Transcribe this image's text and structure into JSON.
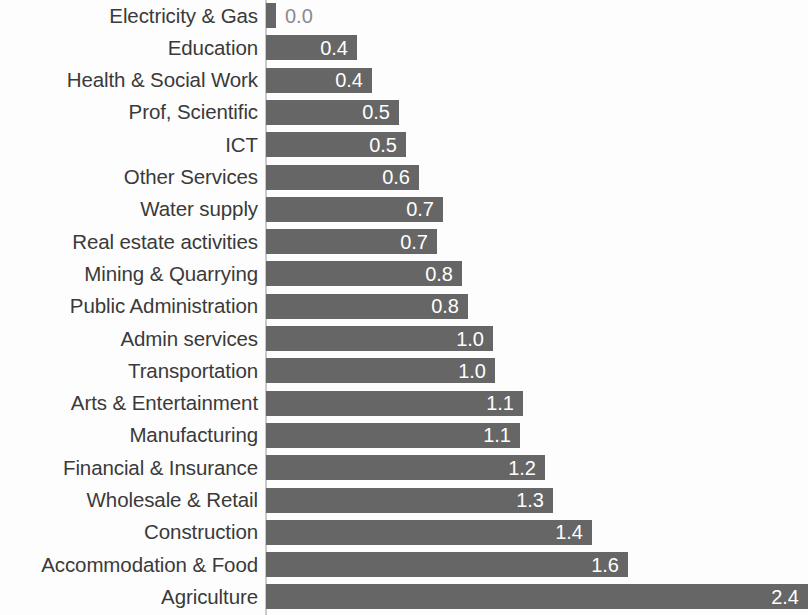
{
  "chart_data": {
    "type": "bar",
    "orientation": "horizontal",
    "title": "",
    "subtitle": "",
    "xlabel": "",
    "ylabel": "",
    "xlim": [
      0,
      2.4
    ],
    "grid": false,
    "legend": false,
    "bar_color": "#666666",
    "value_label_color": "#ffffff",
    "category_label_color": "#3a3a3a",
    "background_color": "#fdfdfd",
    "categories": [
      "Electricity & Gas",
      "Education",
      "Health & Social Work",
      "Prof, Scientific",
      "ICT",
      "Other Services",
      "Water supply",
      "Real estate activities",
      "Mining & Quarrying",
      "Public Administration",
      "Admin services",
      "Transportation",
      "Arts & Entertainment",
      "Manufacturing",
      "Financial & Insurance",
      "Wholesale & Retail",
      "Construction",
      "Accommodation & Food",
      "Agriculture"
    ],
    "values": [
      0.0,
      0.4,
      0.4,
      0.5,
      0.5,
      0.6,
      0.7,
      0.7,
      0.8,
      0.8,
      1.0,
      1.0,
      1.1,
      1.1,
      1.2,
      1.3,
      1.4,
      1.6,
      2.4
    ],
    "value_labels": [
      "0.0",
      "0.4",
      "0.4",
      "0.5",
      "0.5",
      "0.6",
      "0.7",
      "0.7",
      "0.8",
      "0.8",
      "1.0",
      "1.0",
      "1.1",
      "1.1",
      "1.2",
      "1.3",
      "1.4",
      "1.6",
      "2.4"
    ],
    "bars": [
      {
        "category": "Electricity & Gas",
        "value": 0.0,
        "label": "0.0",
        "pixel_length": 10,
        "label_placement": "outside"
      },
      {
        "category": "Education",
        "value": 0.4,
        "label": "0.4",
        "pixel_length": 91,
        "label_placement": "inside"
      },
      {
        "category": "Health & Social Work",
        "value": 0.4,
        "label": "0.4",
        "pixel_length": 106,
        "label_placement": "inside"
      },
      {
        "category": "Prof, Scientific",
        "value": 0.5,
        "label": "0.5",
        "pixel_length": 133,
        "label_placement": "inside"
      },
      {
        "category": "ICT",
        "value": 0.5,
        "label": "0.5",
        "pixel_length": 140,
        "label_placement": "inside"
      },
      {
        "category": "Other Services",
        "value": 0.6,
        "label": "0.6",
        "pixel_length": 153,
        "label_placement": "inside"
      },
      {
        "category": "Water supply",
        "value": 0.7,
        "label": "0.7",
        "pixel_length": 177,
        "label_placement": "inside"
      },
      {
        "category": "Real estate activities",
        "value": 0.7,
        "label": "0.7",
        "pixel_length": 171,
        "label_placement": "inside"
      },
      {
        "category": "Mining & Quarrying",
        "value": 0.8,
        "label": "0.8",
        "pixel_length": 196,
        "label_placement": "inside"
      },
      {
        "category": "Public Administration",
        "value": 0.8,
        "label": "0.8",
        "pixel_length": 202,
        "label_placement": "inside"
      },
      {
        "category": "Admin services",
        "value": 1.0,
        "label": "1.0",
        "pixel_length": 227,
        "label_placement": "inside"
      },
      {
        "category": "Transportation",
        "value": 1.0,
        "label": "1.0",
        "pixel_length": 229,
        "label_placement": "inside"
      },
      {
        "category": "Arts & Entertainment",
        "value": 1.1,
        "label": "1.1",
        "pixel_length": 257,
        "label_placement": "inside"
      },
      {
        "category": "Manufacturing",
        "value": 1.1,
        "label": "1.1",
        "pixel_length": 254,
        "label_placement": "inside"
      },
      {
        "category": "Financial & Insurance",
        "value": 1.2,
        "label": "1.2",
        "pixel_length": 279,
        "label_placement": "inside"
      },
      {
        "category": "Wholesale & Retail",
        "value": 1.3,
        "label": "1.3",
        "pixel_length": 287,
        "label_placement": "inside"
      },
      {
        "category": "Construction",
        "value": 1.4,
        "label": "1.4",
        "pixel_length": 326,
        "label_placement": "inside"
      },
      {
        "category": "Accommodation & Food",
        "value": 1.6,
        "label": "1.6",
        "pixel_length": 362,
        "label_placement": "inside"
      },
      {
        "category": "Agriculture",
        "value": 2.4,
        "label": "2.4",
        "pixel_length": 542,
        "label_placement": "inside"
      }
    ]
  }
}
